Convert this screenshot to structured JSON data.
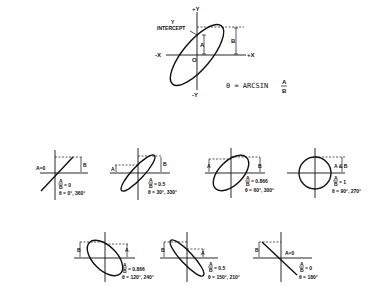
{
  "main_diagram": {
    "axis_labels": {
      "pos_y": "+Y",
      "neg_y": "-Y",
      "pos_x": "+X",
      "neg_x": "-X",
      "origin": "O"
    },
    "intercept_label_line1": "Y",
    "intercept_label_line2": "INTERCEPT",
    "a_label": "A",
    "b_label": "B",
    "formula_prefix": "θ = ARCSIN",
    "formula_num": "A",
    "formula_den": "B"
  },
  "examples": [
    {
      "a_label": "A=0",
      "b_label": "B",
      "ratio_num": "A",
      "ratio_den": "B",
      "ratio_value": "= 0",
      "angle": "θ = 0°, 360°"
    },
    {
      "a_label": "A",
      "b_label": "B",
      "ratio_num": "A",
      "ratio_den": "B",
      "ratio_value": "= 0.5",
      "angle": "θ = 30°, 330°"
    },
    {
      "a_label": "A",
      "b_label": "B",
      "ratio_num": "A",
      "ratio_den": "B",
      "ratio_value": "= 0.866",
      "angle": "θ = 60°, 300°"
    },
    {
      "a_label": "A & B",
      "b_label": "",
      "ratio_num": "A",
      "ratio_den": "B",
      "ratio_value": "= 1",
      "angle": "θ = 90°, 270°"
    },
    {
      "a_label": "A",
      "b_label": "B",
      "ratio_num": "A",
      "ratio_den": "B",
      "ratio_value": "= 0.866",
      "angle": "θ = 120°, 240°"
    },
    {
      "a_label": "A",
      "b_label": "B",
      "ratio_num": "A",
      "ratio_den": "B",
      "ratio_value": "= 0.5",
      "angle": "θ = 150°, 210°"
    },
    {
      "a_label": "A=0",
      "b_label": "B",
      "ratio_num": "A",
      "ratio_den": "B",
      "ratio_value": "= 0",
      "angle": "θ = 180°"
    }
  ]
}
